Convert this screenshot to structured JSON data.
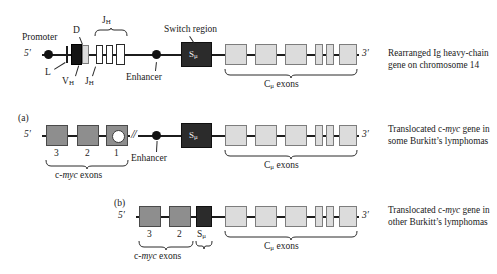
{
  "figure": {
    "type": "gene-structure-diagram",
    "colors": {
      "black_box": "#141414",
      "dark_box": "#2b2b2b",
      "mid_gray_box": "#8e8e8e",
      "light_gray_box": "#dcdcdc",
      "white_box": "#ffffff",
      "line": "#1c1c1c",
      "background": "#ffffff"
    }
  },
  "rows": {
    "top": {
      "panel_id": "",
      "five_prime": "5′",
      "three_prime": "3′",
      "labels": {
        "promoter": "Promoter",
        "d_segment": "D",
        "jh_top": "J",
        "jh_top_sub": "H",
        "switch_region": "Switch region",
        "l_segment": "L",
        "vh": "V",
        "vh_sub": "H",
        "jh_bottom": "J",
        "jh_bottom_sub": "H",
        "enhancer": "Enhancer",
        "smu": "S",
        "smu_sub": "μ",
        "cmu_exons": "C",
        "cmu_exons_sub": "μ",
        "cmu_exons_word": "exons"
      },
      "caption_line1": "Rearranged Ig heavy-chain",
      "caption_line2": "gene on chromosome 14"
    },
    "a": {
      "panel_id": "(a)",
      "five_prime": "5′",
      "three_prime": "3′",
      "exon_numbers": [
        "3",
        "2",
        "1"
      ],
      "labels": {
        "cmyc_exons_prefix": "c-",
        "cmyc_exons_italic": "myc",
        "cmyc_exons_suffix": " exons",
        "enhancer": "Enhancer",
        "smu": "S",
        "smu_sub": "μ",
        "cmu_exons": "C",
        "cmu_exons_sub": "μ",
        "cmu_exons_word": "exons",
        "break_symbol": "//"
      },
      "caption_line1_pre": "Translocated c-",
      "caption_line1_italic": "myc",
      "caption_line1_post": " gene in",
      "caption_line2": "some Burkitt’s lymphomas"
    },
    "b": {
      "panel_id": "(b)",
      "five_prime": "5′",
      "three_prime": "3′",
      "exon_numbers": [
        "3",
        "2"
      ],
      "labels": {
        "cmyc_exons_prefix": "c-",
        "cmyc_exons_italic": "myc",
        "cmyc_exons_suffix": " exons",
        "smu": "S",
        "smu_sub": "μ",
        "cmu_exons": "C",
        "cmu_exons_sub": "μ",
        "cmu_exons_word": "exons"
      },
      "caption_line1_pre": "Translocated c-",
      "caption_line1_italic": "myc",
      "caption_line1_post": " gene in",
      "caption_line2": "other Burkitt’s lymphomas"
    }
  }
}
